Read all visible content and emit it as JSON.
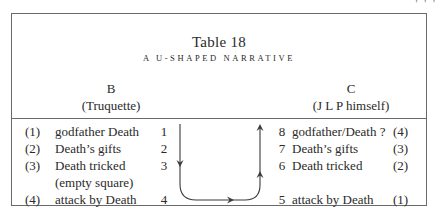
{
  "page": {
    "corner_mark": "' ' '"
  },
  "table": {
    "title": "Table 18",
    "subtitle": "A U-SHAPED NARRATIVE",
    "columns": {
      "left": {
        "letter": "B",
        "attribution": "(Truquette)"
      },
      "right": {
        "letter": "C",
        "attribution": "(J L P himself)"
      }
    },
    "left_rows": [
      {
        "index": "(1)",
        "text": "godfather Death",
        "number": "1"
      },
      {
        "index": "(2)",
        "text": "Death’s gifts",
        "number": "2"
      },
      {
        "index": "(3)",
        "text": "Death tricked",
        "number": "3"
      },
      {
        "index": "",
        "text": "(empty square)",
        "number": ""
      },
      {
        "index": "(4)",
        "text": "attack by Death",
        "number": "4"
      }
    ],
    "right_rows": [
      {
        "number": "8",
        "text": "godfather/Death ?",
        "index": "(4)"
      },
      {
        "number": "7",
        "text": "Death’s gifts",
        "index": "(3)"
      },
      {
        "number": "6",
        "text": "Death tricked",
        "index": "(2)"
      },
      {
        "number": "",
        "text": "",
        "index": ""
      },
      {
        "number": "5",
        "text": "attack by Death",
        "index": "(1)"
      }
    ],
    "diagram": {
      "description": "U-shaped arrow: down from 1 to 4, across, up from 5 to 8",
      "line_color": "#3a3a3a"
    }
  }
}
